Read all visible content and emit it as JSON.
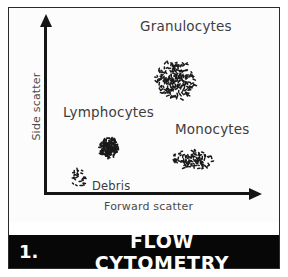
{
  "figure": {
    "number": "1.",
    "title": "FLOW CYTOMETRY",
    "sample_note": "sample: human blood",
    "frame_color": "#2b2b2b",
    "title_bar_color": "#070707",
    "title_text_color": "#ffffff",
    "dot_color": "#1a1a1a"
  },
  "chart_data": {
    "type": "scatter",
    "title": "FLOW CYTOMETRY",
    "subtitle": "sample: human blood",
    "xlabel": "Forward scatter",
    "ylabel": "Side scatter",
    "xlim": [
      0,
      100
    ],
    "ylim": [
      0,
      100
    ],
    "grid": false,
    "axis_ticks": false,
    "legend": "inline-annotations",
    "series": [
      {
        "name": "Granulocytes",
        "label_position": "above",
        "n_points": 190,
        "center": [
          61,
          75
        ],
        "spread": [
          15,
          16
        ],
        "shape": "dense-round",
        "density": "high"
      },
      {
        "name": "Lymphocytes",
        "label_position": "above-left",
        "n_points": 120,
        "center": [
          27,
          44
        ],
        "spread": [
          7,
          8
        ],
        "shape": "very-dense-round",
        "density": "very-high"
      },
      {
        "name": "Monocytes",
        "label_position": "above",
        "n_points": 95,
        "center": [
          70,
          34
        ],
        "spread": [
          15,
          7
        ],
        "shape": "loose-oval",
        "density": "medium"
      },
      {
        "name": "Debris",
        "label_position": "right",
        "n_points": 22,
        "center": [
          15,
          15
        ],
        "spread": [
          6,
          6
        ],
        "shape": "sparse-round",
        "density": "low"
      }
    ]
  },
  "labels": {
    "granulocytes": "Granulocytes",
    "lymphocytes": "Lymphocytes",
    "monocytes": "Monocytes",
    "debris": "Debris",
    "x_axis": "Forward scatter",
    "y_axis": "Side scatter"
  }
}
